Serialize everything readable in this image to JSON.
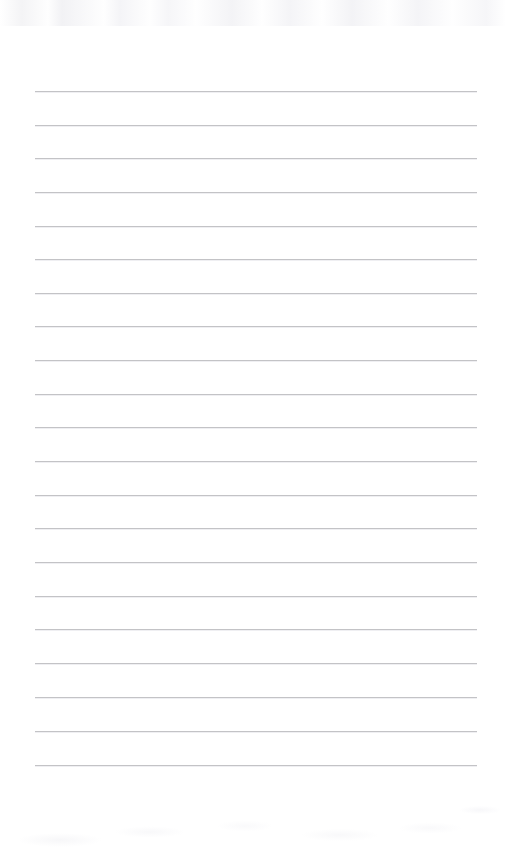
{
  "document": {
    "type": "scanned-lined-paper",
    "title": "Blank Lined Notebook Page",
    "page_width": 506,
    "page_height": 853,
    "background_color": "#ffffff",
    "rule_color": "#b9b9bd",
    "rule_shadow_color": "#ededf0",
    "text_content": "",
    "handwriting_present": "none",
    "printed_text_present": "none"
  },
  "ruling": {
    "line_count": 21,
    "left_margin_x": 35,
    "right_margin_x": 477,
    "line_length": 442,
    "first_line_y": 91,
    "line_pitch": 33.7,
    "line_thickness": 1,
    "margin_rule_present": "none",
    "lines": [
      {
        "index": 1,
        "y": 91,
        "x1": 35,
        "x2": 477
      },
      {
        "index": 2,
        "y": 125,
        "x1": 35,
        "x2": 477
      },
      {
        "index": 3,
        "y": 158,
        "x1": 35,
        "x2": 477
      },
      {
        "index": 4,
        "y": 192,
        "x1": 35,
        "x2": 477
      },
      {
        "index": 5,
        "y": 226,
        "x1": 35,
        "x2": 477
      },
      {
        "index": 6,
        "y": 259,
        "x1": 35,
        "x2": 477
      },
      {
        "index": 7,
        "y": 293,
        "x1": 35,
        "x2": 477
      },
      {
        "index": 8,
        "y": 326,
        "x1": 35,
        "x2": 477
      },
      {
        "index": 9,
        "y": 360,
        "x1": 35,
        "x2": 477
      },
      {
        "index": 10,
        "y": 394,
        "x1": 35,
        "x2": 477
      },
      {
        "index": 11,
        "y": 427,
        "x1": 35,
        "x2": 477
      },
      {
        "index": 12,
        "y": 461,
        "x1": 35,
        "x2": 477
      },
      {
        "index": 13,
        "y": 495,
        "x1": 35,
        "x2": 477
      },
      {
        "index": 14,
        "y": 528,
        "x1": 35,
        "x2": 477
      },
      {
        "index": 15,
        "y": 562,
        "x1": 35,
        "x2": 477
      },
      {
        "index": 16,
        "y": 596,
        "x1": 35,
        "x2": 477
      },
      {
        "index": 17,
        "y": 629,
        "x1": 35,
        "x2": 477
      },
      {
        "index": 18,
        "y": 663,
        "x1": 35,
        "x2": 477
      },
      {
        "index": 19,
        "y": 697,
        "x1": 35,
        "x2": 477
      },
      {
        "index": 20,
        "y": 731,
        "x1": 35,
        "x2": 477
      },
      {
        "index": 21,
        "y": 765,
        "x1": 35,
        "x2": 477
      }
    ]
  },
  "artifacts": {
    "top_noise_band": {
      "y": 0,
      "height": 26,
      "description": "faint scanner streak band"
    },
    "bottom_noise_area": {
      "y": 790,
      "height": 63,
      "description": "faint scanner speckle area"
    }
  }
}
